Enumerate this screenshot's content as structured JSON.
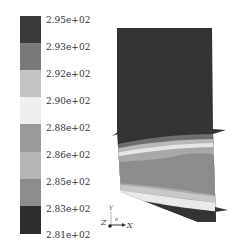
{
  "legend": {
    "labels": [
      "2.95e+02",
      "2.93e+02",
      "2.92e+02",
      "2.90e+02",
      "2.88e+02",
      "2.86e+02",
      "2.85e+02",
      "2.83e+02",
      "2.81e+02"
    ],
    "bands": [
      "#3a3a3a",
      "#7a7a7a",
      "#c4c4c4",
      "#efefef",
      "#9a9a9a",
      "#b6b6b6",
      "#8c8c8c",
      "#2e2e2e"
    ]
  },
  "triad": {
    "y_label": "Y",
    "z_label": "Z",
    "x_label": "X"
  },
  "colors": {
    "plate_dark": "#333333",
    "band_mid": "#8e8e8e",
    "band_light": "#dcdcdc"
  }
}
